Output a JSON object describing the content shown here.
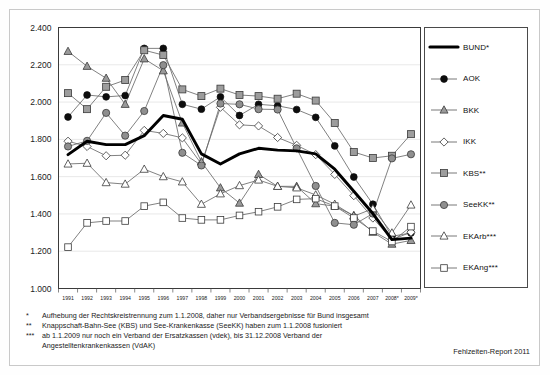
{
  "source_note": "Fehlzeiten-Report 2011",
  "footnotes": [
    {
      "mark": "*",
      "text": "Aufhebung der Rechtskreistrennung zum 1.1.2008, daher nur Verbandsergebnisse für Bund insgesamt"
    },
    {
      "mark": "**",
      "text": "Knappschaft-Bahn-See (KBS) und See-Krankenkasse (SeeKK) haben zum 1.1.2008 fusioniert"
    },
    {
      "mark": "***",
      "text": "ab 1.1.2009 nur noch ein Verband der Ersatzkassen (vdek), bis 31.12.2008 Verband der",
      "cont": "Angestelltenkrankenkassen (VdAK)"
    }
  ],
  "legend": {
    "items": [
      {
        "label": "BUND*",
        "marker": "line",
        "series": "BUND"
      },
      {
        "label": "AOK",
        "marker": "circle-black",
        "series": "AOK"
      },
      {
        "label": "BKK",
        "marker": "triangle-gray",
        "series": "BKK"
      },
      {
        "label": "IKK",
        "marker": "diamond-white",
        "series": "IKK"
      },
      {
        "label": "KBS**",
        "marker": "square-gray",
        "series": "KBS"
      },
      {
        "label": "SeeKK**",
        "marker": "circle-gray",
        "series": "SeeKK"
      },
      {
        "label": "EKArb***",
        "marker": "triangle-white",
        "series": "EKArb"
      },
      {
        "label": "EKAng***",
        "marker": "square-white",
        "series": "EKAng"
      }
    ]
  },
  "chart_data": {
    "type": "line",
    "title": "",
    "xlabel": "",
    "ylabel": "",
    "ylim": [
      1000,
      2400
    ],
    "yticks": [
      1000,
      1200,
      1400,
      1600,
      1800,
      2000,
      2200,
      2400
    ],
    "ytick_labels": [
      "1.000",
      "1.200",
      "1.400",
      "1.600",
      "1.800",
      "2.000",
      "2.200",
      "2.400"
    ],
    "grid": true,
    "legend_position": "right",
    "categories": [
      "1991",
      "1992",
      "1993",
      "1994",
      "1995",
      "1996",
      "1997",
      "1998",
      "1999",
      "2000",
      "2001",
      "2002",
      "2003",
      "2004",
      "2005",
      "2006",
      "2007",
      "2008*",
      "2009*"
    ],
    "series": [
      {
        "name": "BUND*",
        "key": "BUND",
        "marker": "line",
        "color": "#000000",
        "values": [
          1718,
          1790,
          1772,
          1772,
          1820,
          1928,
          1908,
          1722,
          1668,
          1722,
          1752,
          1742,
          1738,
          1722,
          1640,
          1522,
          1402,
          1262,
          1270
        ]
      },
      {
        "name": "AOK",
        "key": "AOK",
        "marker": "circle-black",
        "color": "#000000",
        "values": [
          1920,
          2038,
          2028,
          2035,
          2288,
          2288,
          1988,
          1962,
          2028,
          1928,
          1988,
          1980,
          1960,
          1918,
          1765,
          1598,
          1452,
          1280,
          1298
        ]
      },
      {
        "name": "BKK",
        "key": "BKK",
        "marker": "triangle-gray",
        "color": "#8c8c8c",
        "values": [
          2272,
          2192,
          2128,
          1988,
          2232,
          2168,
          1888,
          1680,
          1540,
          1458,
          1612,
          1548,
          1548,
          1455,
          1442,
          1392,
          1302,
          1238,
          1258
        ]
      },
      {
        "name": "IKK",
        "key": "IKK",
        "marker": "diamond-white",
        "color": "#ffffff",
        "values": [
          1790,
          1762,
          1712,
          1715,
          1848,
          1832,
          1808,
          1668,
          1972,
          1878,
          1872,
          1810,
          1768,
          1718,
          1612,
          1498,
          1378,
          1262,
          1302
        ]
      },
      {
        "name": "KBS**",
        "key": "KBS",
        "marker": "square-gray",
        "color": "#9a9a9a",
        "values": [
          2048,
          1962,
          2082,
          2118,
          2278,
          2252,
          2068,
          2032,
          2072,
          2038,
          2032,
          2018,
          2045,
          2008,
          1888,
          1732,
          1700,
          1712,
          1828
        ]
      },
      {
        "name": "SeeKK**",
        "key": "SeeKK",
        "marker": "circle-gray",
        "color": "#8f8f8f",
        "values": [
          1762,
          1792,
          1942,
          1820,
          1952,
          2198,
          1728,
          1660,
          1992,
          1988,
          1962,
          1960,
          1752,
          1550,
          1352,
          1342,
          1402,
          1698,
          1720
        ]
      },
      {
        "name": "EKArb***",
        "key": "EKArb",
        "marker": "triangle-white",
        "color": "#ffffff",
        "values": [
          1668,
          1672,
          1568,
          1560,
          1640,
          1600,
          1572,
          1452,
          1508,
          1552,
          1582,
          1548,
          1540,
          1502,
          1452,
          1388,
          1428,
          1298,
          1448
        ]
      },
      {
        "name": "EKAng***",
        "key": "EKAng",
        "marker": "square-white",
        "color": "#ffffff",
        "values": [
          1222,
          1352,
          1362,
          1362,
          1442,
          1462,
          1378,
          1368,
          1368,
          1392,
          1412,
          1438,
          1478,
          1482,
          1442,
          1378,
          1308,
          1252,
          1332
        ]
      }
    ]
  }
}
